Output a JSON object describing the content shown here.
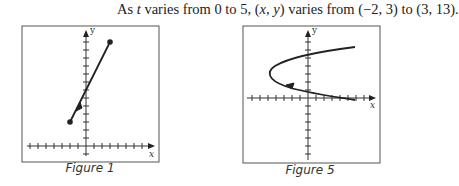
{
  "text": {
    "prefix": "As ",
    "t": "t",
    "mid1": " varies from 0 to 5, (",
    "x": "x",
    "comma": ", ",
    "y": "y",
    "mid2": ") varies from (−2, 3) to (3, 13)."
  },
  "figures": [
    {
      "caption": "Figure 1",
      "axis_x": "x",
      "axis_y": "y"
    },
    {
      "caption": "Figure 5",
      "axis_x": "x",
      "axis_y": "y"
    }
  ]
}
